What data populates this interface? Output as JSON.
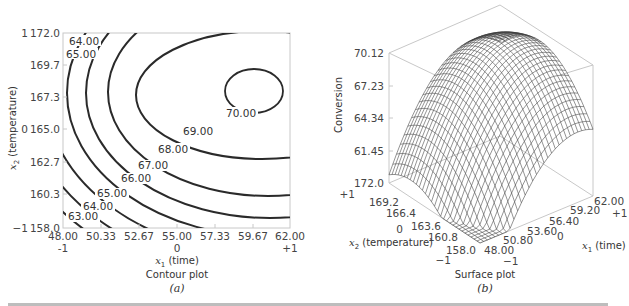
{
  "chart_data": [
    {
      "type": "contour",
      "panel_label": "(a)",
      "title": "Contour plot",
      "xlabel": "x1 (time)",
      "ylabel": "x2 (temperature)",
      "x_ticks": [
        "48.00",
        "50.33",
        "52.67",
        "55.00",
        "57.33",
        "59.67",
        "62.00"
      ],
      "x_coded_ticks": [
        {
          "value": "-1",
          "at": "48.00"
        },
        {
          "value": "0",
          "at": "55.00"
        },
        {
          "value": "+1",
          "at": "62.00"
        }
      ],
      "y_ticks": [
        "158.0",
        "160.3",
        "162.7",
        "165.0",
        "167.3",
        "169.7",
        "172.0"
      ],
      "y_coded_ticks": [
        {
          "value": "-1",
          "at": "158.0"
        },
        {
          "value": "0",
          "at": "165.0"
        },
        {
          "value": "1",
          "at": "172.0"
        }
      ],
      "xlim": [
        48.0,
        62.0
      ],
      "ylim": [
        158.0,
        172.0
      ],
      "contour_levels": [
        "63.00",
        "64.00",
        "65.00",
        "66.00",
        "67.00",
        "68.00",
        "69.00",
        "70.00"
      ],
      "top_left_labels": [
        "64.00",
        "65.00"
      ],
      "maximum_region": {
        "x": 59.7,
        "y": 167.8,
        "level": "70.00"
      },
      "grid": false
    },
    {
      "type": "surface",
      "panel_label": "(b)",
      "title": "Surface plot",
      "zlabel": "Conversion",
      "z_ticks": [
        "61.45",
        "64.34",
        "67.23",
        "70.12"
      ],
      "zlim": [
        61.45,
        70.12
      ],
      "x_axis_label": "x1 (time)",
      "x_ticks": [
        "48.00",
        "50.80",
        "53.60",
        "56.40",
        "59.20",
        "62.00"
      ],
      "x_coded_ticks": [
        {
          "value": "-1",
          "at": "48.00"
        },
        {
          "value": "0",
          "at": "56.40"
        },
        {
          "value": "+1",
          "at": "62.00"
        }
      ],
      "y_axis_label": "x2 (temperature)",
      "y_ticks": [
        "172.0",
        "169.2",
        "166.4",
        "163.6",
        "160.8",
        "158.0"
      ],
      "y_coded_ticks": [
        {
          "value": "+1",
          "at": "172.0"
        },
        {
          "value": "0",
          "at": "163.6"
        },
        {
          "value": "-1",
          "at": "158.0"
        }
      ],
      "mesh": "wireframe"
    }
  ],
  "contour": {
    "title": "Contour plot",
    "panel": "(a)",
    "xlabel_var": "x",
    "xlabel_sub": "1",
    "xlabel_text": " (time)",
    "ylabel_var": "x",
    "ylabel_sub": "2",
    "ylabel_text": " (temperature)",
    "xticks": [
      "48.00",
      "50.33",
      "52.67",
      "55.00",
      "57.33",
      "59.67",
      "62.00"
    ],
    "xcoded": [
      "-1",
      "0",
      "+1"
    ],
    "yticks": [
      "172.0",
      "169.7",
      "167.3",
      "165.0",
      "162.7",
      "160.3",
      "158.0"
    ],
    "ycoded": [
      "1",
      "0",
      "−1"
    ],
    "labels": {
      "l63": "63.00",
      "l64": "64.00",
      "l65": "65.00",
      "l66": "66.00",
      "l67": "67.00",
      "l68": "68.00",
      "l69": "69.00",
      "l70": "70.00",
      "tl64": "64.00",
      "tl65": "65.00"
    }
  },
  "surface": {
    "title": "Surface plot",
    "panel": "(b)",
    "zlabel": "Conversion",
    "zticks": [
      "70.12",
      "67.23",
      "64.34",
      "61.45"
    ],
    "yticks": [
      "172.0",
      "169.2",
      "166.4",
      "163.6",
      "160.8",
      "158.0"
    ],
    "ycoded": [
      "+1",
      "0",
      "−1"
    ],
    "ylabel_var": "x",
    "ylabel_sub": "2",
    "ylabel_text": " (temperature)",
    "xticks": [
      "48.00",
      "50.80",
      "53.60",
      "56.40",
      "59.20",
      "62.00"
    ],
    "xcoded": [
      "−1",
      "0",
      "+1"
    ],
    "xlabel_var": "x",
    "xlabel_sub": "1",
    "xlabel_text": " (time)"
  }
}
